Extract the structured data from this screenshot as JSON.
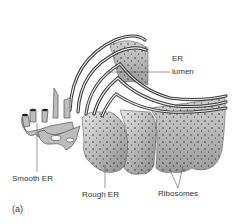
{
  "figure": {
    "panel_label": "(a)",
    "labels": {
      "er": "ER",
      "lumen": "lumen",
      "smooth_er": "Smooth ER",
      "rough_er": "Rough ER",
      "ribosomes": "Ribosomes"
    },
    "colors": {
      "membrane_dark": "#3a3a3a",
      "membrane_mid": "#8a8a8a",
      "membrane_light": "#d8d8d8",
      "ribosome": "#222222",
      "text": "#333333",
      "leader": "#555555"
    }
  }
}
